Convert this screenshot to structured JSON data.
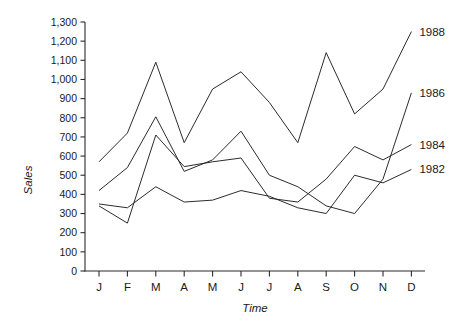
{
  "chart_data": {
    "type": "line",
    "title": "",
    "xlabel": "Time",
    "ylabel": "Sales",
    "categories": [
      "J",
      "F",
      "M",
      "A",
      "M",
      "J",
      "J",
      "A",
      "S",
      "O",
      "N",
      "D"
    ],
    "x_tick_labels": [
      "J",
      "F",
      "M",
      "A",
      "M",
      "J",
      "J",
      "A",
      "S",
      "O",
      "N",
      "D"
    ],
    "y_tick_labels": [
      "0",
      "100",
      "200",
      "300",
      "400",
      "500",
      "600",
      "700",
      "800",
      "900",
      "1,000",
      "1,100",
      "1,200",
      "1,300"
    ],
    "y_tick_values": [
      0,
      100,
      200,
      300,
      400,
      500,
      600,
      700,
      800,
      900,
      1000,
      1100,
      1200,
      1300
    ],
    "ylim": [
      0,
      1300
    ],
    "grid": false,
    "legend_position": "right-inline-end-of-line",
    "series": [
      {
        "name": "1988",
        "label": "1988",
        "values": [
          570,
          720,
          1090,
          670,
          950,
          1040,
          880,
          670,
          1140,
          820,
          950,
          1250
        ]
      },
      {
        "name": "1986",
        "label": "1986",
        "values": [
          420,
          540,
          805,
          520,
          580,
          730,
          500,
          440,
          340,
          300,
          480,
          930
        ]
      },
      {
        "name": "1984",
        "label": "1984",
        "values": [
          340,
          250,
          710,
          545,
          570,
          590,
          380,
          360,
          480,
          650,
          580,
          660
        ]
      },
      {
        "name": "1982",
        "label": "1982",
        "values": [
          350,
          330,
          440,
          360,
          370,
          420,
          390,
          330,
          300,
          500,
          460,
          530
        ]
      }
    ]
  },
  "axes": {
    "y_axis_title": "Sales",
    "x_axis_title": "Time"
  }
}
